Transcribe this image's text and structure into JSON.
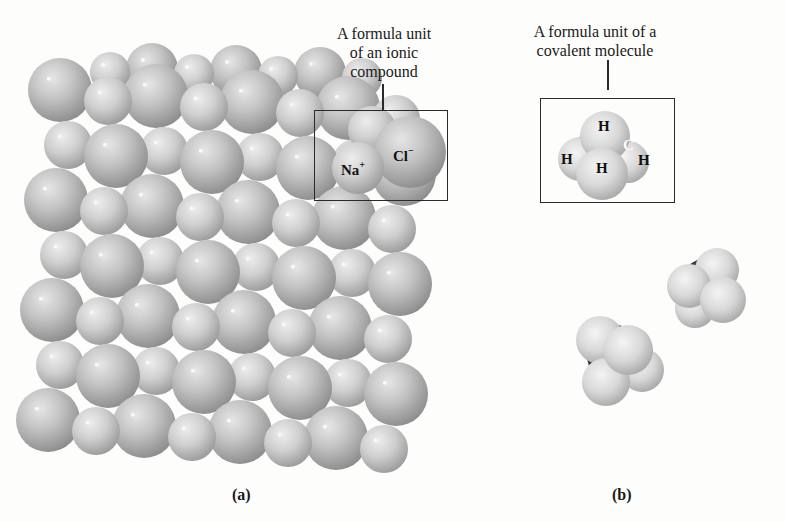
{
  "figure": {
    "panel_a": {
      "label": "(a)",
      "callout": {
        "line1": "A formula unit",
        "line2": "of an ionic",
        "line3": "compound"
      },
      "ions": [
        {
          "symbol": "Na",
          "charge": "+"
        },
        {
          "symbol": "Cl",
          "charge": "−"
        }
      ],
      "description": "Sodium chloride crystal lattice of packed spheres"
    },
    "panel_b": {
      "label": "(b)",
      "callout": {
        "line1": "A formula unit of a",
        "line2": "covalent molecule"
      },
      "atoms": [
        "H",
        "H",
        "C",
        "H",
        "H"
      ],
      "description": "Methane molecules (space-filling models)"
    },
    "colors": {
      "background": "#fdfdfc",
      "sphere_light": "#dcdcdc",
      "sphere_mid": "#b4b4b4",
      "sphere_dark": "#8a8a8a",
      "carbon": "#3a3a3a",
      "box_line": "#2a2a2a"
    }
  }
}
